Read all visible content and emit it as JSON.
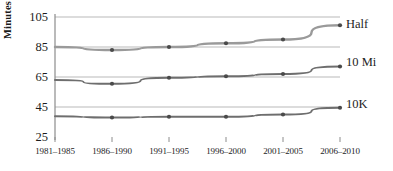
{
  "chart_data": {
    "type": "line",
    "title": "",
    "xlabel": "",
    "ylabel": "Minutes",
    "categories": [
      "1981–1985",
      "1986–1990",
      "1991–1995",
      "1996–2000",
      "2001–2005",
      "2006–2010"
    ],
    "ylim": [
      25,
      105
    ],
    "yticks": [
      25,
      45,
      65,
      85,
      105
    ],
    "grid": true,
    "legend_position": "right-inline",
    "series": [
      {
        "name": "Half",
        "color": "#9a9a9a",
        "values": [
          85,
          83,
          85,
          87.5,
          90,
          99.5
        ]
      },
      {
        "name": "10 Mi",
        "color": "#6e6e6e",
        "values": [
          63,
          60.5,
          64.5,
          65.5,
          67,
          72
        ]
      },
      {
        "name": "10K",
        "color": "#6e6e6e",
        "values": [
          38.8,
          38,
          38.5,
          38.5,
          40,
          44.5
        ]
      }
    ]
  },
  "axis": {
    "y_title": "Minutes",
    "y_tick_labels": [
      "105",
      "85",
      "65",
      "45",
      "25"
    ],
    "x_tick_labels": [
      "1981–1985",
      "1986–1990",
      "1991–1995",
      "1996–2000",
      "2001–2005",
      "2006–2010"
    ]
  },
  "series_labels": [
    "Half",
    "10 Mi",
    "10K"
  ],
  "colors": {
    "axis_line": "#8c8c8c",
    "grid_line": "#b3b3b3",
    "half_line": "#9a9a9a",
    "ten_mile_line": "#6e6e6e",
    "ten_k_line": "#6e6e6e",
    "text": "#1d1d1d"
  }
}
